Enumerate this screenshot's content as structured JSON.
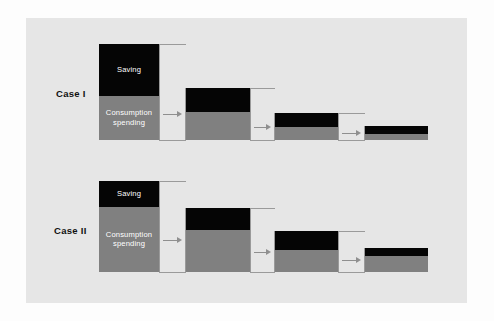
{
  "figure": {
    "background_color": "#fdfdfd",
    "panel_color": "#e6e6e6",
    "saving_color": "#050505",
    "consumption_color": "#808080",
    "connector_color": "#9a9a9a",
    "label_text_color": "#ffffff"
  },
  "cases": [
    {
      "label": "Case I",
      "label_x": 56,
      "label_y": 88,
      "baseline": 140,
      "bars": [
        {
          "x": 99,
          "width": 60,
          "top": 44,
          "divider": 96,
          "saving_label": "Saving",
          "consumption_label_line1": "Consumption",
          "consumption_label_line2": "spending",
          "show_labels": true
        },
        {
          "x": 186,
          "width": 64,
          "top": 88,
          "divider": 112,
          "show_labels": false
        },
        {
          "x": 275,
          "width": 63,
          "top": 113,
          "divider": 127,
          "show_labels": false
        },
        {
          "x": 365,
          "width": 63,
          "top": 126,
          "divider": 134,
          "show_labels": false
        }
      ]
    },
    {
      "label": "Case II",
      "label_x": 54,
      "label_y": 225,
      "baseline": 272,
      "bars": [
        {
          "x": 99,
          "width": 60,
          "top": 181,
          "divider": 207,
          "saving_label": "Saving",
          "consumption_label_line1": "Consumption",
          "consumption_label_line2": "spending",
          "show_labels": true
        },
        {
          "x": 186,
          "width": 64,
          "top": 208,
          "divider": 230,
          "show_labels": false
        },
        {
          "x": 275,
          "width": 63,
          "top": 231,
          "divider": 250,
          "show_labels": false
        },
        {
          "x": 365,
          "width": 63,
          "top": 248,
          "divider": 256,
          "show_labels": false
        }
      ]
    }
  ],
  "chart_data": {
    "type": "bar",
    "title": "",
    "xlabel": "",
    "ylabel": "",
    "grid": false,
    "legend": [
      "Saving",
      "Consumption spending"
    ],
    "annotations": [
      "Case I",
      "Case II"
    ],
    "series": [
      {
        "name": "Case I",
        "categories": [
          "Round 1",
          "Round 2",
          "Round 3",
          "Round 4"
        ],
        "saving": [
          52,
          24,
          14,
          8
        ],
        "consumption": [
          44,
          28,
          13,
          6
        ],
        "total": [
          96,
          52,
          27,
          14
        ]
      },
      {
        "name": "Case II",
        "categories": [
          "Round 1",
          "Round 2",
          "Round 3",
          "Round 4"
        ],
        "saving": [
          26,
          22,
          19,
          8
        ],
        "consumption": [
          65,
          42,
          22,
          16
        ],
        "total": [
          91,
          64,
          41,
          24
        ]
      }
    ]
  }
}
